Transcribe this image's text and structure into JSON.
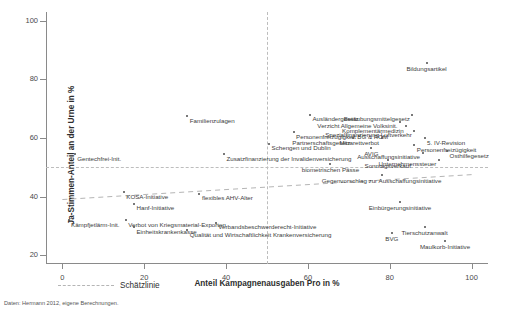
{
  "chart_data": {
    "type": "scatter",
    "title": "",
    "xlabel": "Anteil Kampagnenausgaben Pro in %",
    "ylabel": "Ja-Stimmen-Anteil an der Urne in %",
    "xlim": [
      -4,
      104
    ],
    "ylim": [
      17,
      103
    ],
    "xticks": [
      0,
      20,
      40,
      60,
      80,
      100
    ],
    "yticks": [
      20,
      40,
      60,
      80,
      100
    ],
    "xtick_labels": [
      "0",
      "20",
      "40",
      "60",
      "80",
      "100"
    ],
    "ytick_labels": [
      "20",
      "40",
      "60",
      "80",
      "100"
    ],
    "grid": false,
    "legend_position": "below-left",
    "reference_lines": {
      "horizontal_50": 50,
      "vertical_50": 50,
      "fit_line": {
        "x": [
          0,
          100
        ],
        "y": [
          39.0,
          47.5
        ]
      }
    },
    "legend": [
      {
        "label": "Schätzlinie",
        "style": "dashed"
      }
    ],
    "source_note": "Daten: Hermann 2012, eigene Berechnungen.",
    "points": [
      {
        "label": "Bildungsartikel",
        "x": 89.0,
        "y": 85.5,
        "pos": "below"
      },
      {
        "label": "Familienzulagen",
        "x": 30.5,
        "y": 67.5,
        "pos": "right"
      },
      {
        "label": "Ausländergesetz",
        "x": 60.5,
        "y": 68.0,
        "pos": "right"
      },
      {
        "label": "Betäubungsmittelgesetz",
        "x": 85.5,
        "y": 68.0,
        "pos": "left"
      },
      {
        "label": "Verzicht Allgemeine Volksinit.",
        "x": 82.5,
        "y": 65.5,
        "pos": "left"
      },
      {
        "label": "Komplementärmedizin",
        "x": 84.0,
        "y": 64.0,
        "pos": "left"
      },
      {
        "label": "Spezialfinanzierung Luftverkehr",
        "x": 86.0,
        "y": 62.5,
        "pos": "left"
      },
      {
        "label": "Personenfreizügigkeit BG & ROM",
        "x": 56.5,
        "y": 62.0,
        "pos": "right"
      },
      {
        "label": "Partnerschaftsgesetz",
        "x": 71.0,
        "y": 60.0,
        "pos": "left"
      },
      {
        "label": "Minarettverbot",
        "x": 78.0,
        "y": 60.0,
        "pos": "left"
      },
      {
        "label": "5. IV-Revision",
        "x": 88.5,
        "y": 60.0,
        "pos": "right"
      },
      {
        "label": "Schengen und Dublin",
        "x": 50.5,
        "y": 58.0,
        "pos": "right"
      },
      {
        "label": "Personenfreizügigkeit",
        "x": 86.0,
        "y": 57.5,
        "pos": "right"
      },
      {
        "label": "AVIG",
        "x": 75.5,
        "y": 56.5,
        "pos": "below"
      },
      {
        "label": "Ausschaffungsinitiative",
        "x": 88.0,
        "y": 55.0,
        "pos": "left"
      },
      {
        "label": "Osthilfegesetz",
        "x": 94.0,
        "y": 55.5,
        "pos": "right"
      },
      {
        "label": "Sonntagsverkauf",
        "x": 79.5,
        "y": 52.5,
        "pos": "below"
      },
      {
        "label": "Unternehmenssteuer",
        "x": 92.0,
        "y": 52.5,
        "pos": "left"
      },
      {
        "label": "Zusatzfinanzierung der Invalidenversicherung",
        "x": 39.5,
        "y": 54.5,
        "pos": "right"
      },
      {
        "label": "Gentechfrei-Init.",
        "x": 3.0,
        "y": 54.5,
        "pos": "right"
      },
      {
        "label": "biometrischen Pässe",
        "x": 65.5,
        "y": 51.0,
        "pos": "below"
      },
      {
        "label": "Gegenvorschlag zur Ausschaffungsinitiative",
        "x": 78.0,
        "y": 47.5,
        "pos": "below"
      },
      {
        "label": "KOSA-Initiative",
        "x": 15.0,
        "y": 41.5,
        "pos": "right"
      },
      {
        "label": "flexibles AHV-Alter",
        "x": 33.5,
        "y": 41.0,
        "pos": "right"
      },
      {
        "label": "Hanf-Initiative",
        "x": 17.5,
        "y": 37.5,
        "pos": "right"
      },
      {
        "label": "Einbürgerungsinitiative",
        "x": 82.5,
        "y": 38.0,
        "pos": "below"
      },
      {
        "label": "Kämpfjetlärm-Init.",
        "x": 1.5,
        "y": 32.0,
        "pos": "right"
      },
      {
        "label": "Verbot von Kriegsmaterial-Exporten",
        "x": 15.5,
        "y": 32.0,
        "pos": "right"
      },
      {
        "label": "Einheitskrankenkasse",
        "x": 17.5,
        "y": 29.5,
        "pos": "right"
      },
      {
        "label": "Verbandsbeschwerderecht-Initiative",
        "x": 37.5,
        "y": 31.0,
        "pos": "right"
      },
      {
        "label": "Qualität und Wirtschaftlichkeit Krankenversicherung",
        "x": 30.5,
        "y": 28.5,
        "pos": "right"
      },
      {
        "label": "Tierschutzanwalt",
        "x": 88.5,
        "y": 29.5,
        "pos": "below"
      },
      {
        "label": "BVG",
        "x": 80.5,
        "y": 27.5,
        "pos": "below"
      },
      {
        "label": "Maulkorb-Initiative",
        "x": 93.5,
        "y": 25.0,
        "pos": "below"
      }
    ]
  }
}
